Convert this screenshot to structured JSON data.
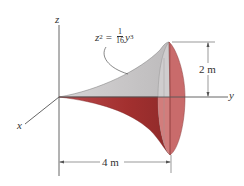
{
  "figure": {
    "axes": {
      "x_label": "x",
      "y_label": "y",
      "z_label": "z"
    },
    "equation": {
      "lhs_var": "z",
      "lhs_exp": "2",
      "equals": "=",
      "frac_num": "1",
      "frac_den": "16",
      "rhs_var": "y",
      "rhs_exp": "3"
    },
    "dimensions": {
      "height_label": "2 m",
      "length_label": "4 m"
    },
    "colors": {
      "upper_surface": "#c9c7c8",
      "lower_surface": "#a8383a",
      "disk_face_left": "#d98c8a",
      "disk_face_right": "#c86b6a",
      "line": "#555555"
    }
  }
}
